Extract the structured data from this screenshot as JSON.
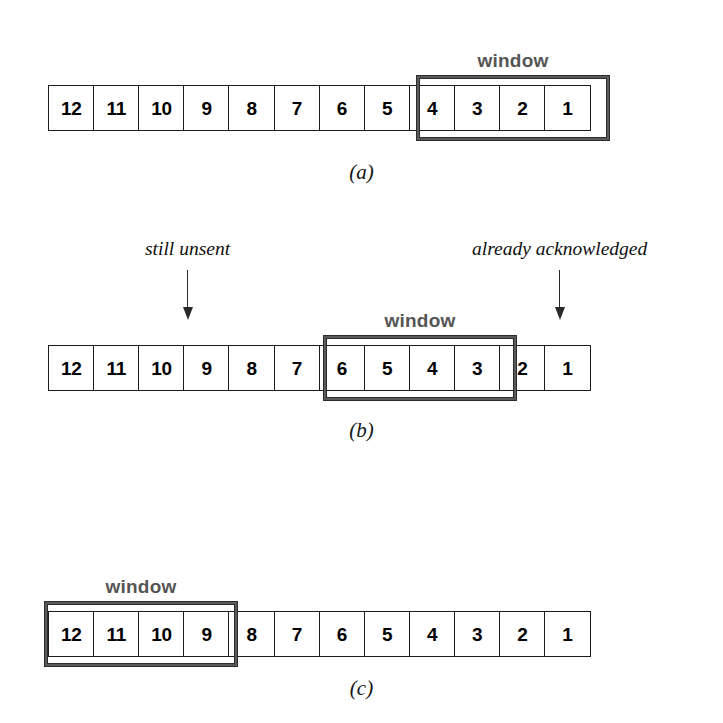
{
  "figure": {
    "colors": {
      "window_border": "#5a5a5a",
      "window_border_outline": "#2c2c2c",
      "window_label": "#555555",
      "cell_border": "#1b1b1b",
      "cell_text": "#000000",
      "annotation_text": "#101010",
      "background": "#ffffff"
    },
    "window_label_text": "window"
  },
  "panels": [
    {
      "id": "a",
      "caption": "(a)",
      "cells": [
        "12",
        "11",
        "10",
        "9",
        "8",
        "7",
        "6",
        "5",
        "4",
        "3",
        "2",
        "1"
      ],
      "window_label": "window",
      "window_start_index": 8,
      "window_end_index": 11,
      "window_cells": [
        "4",
        "3",
        "2",
        "1"
      ],
      "annotations": []
    },
    {
      "id": "b",
      "caption": "(b)",
      "cells": [
        "12",
        "11",
        "10",
        "9",
        "8",
        "7",
        "6",
        "5",
        "4",
        "3",
        "2",
        "1"
      ],
      "window_label": "window",
      "window_start_index": 6,
      "window_end_index": 9,
      "window_cells": [
        "6",
        "5",
        "4",
        "3"
      ],
      "annotations": [
        {
          "text": "still unsent",
          "points_to_index": 3
        },
        {
          "text": "already acknowledged",
          "points_to_index": 10
        }
      ]
    },
    {
      "id": "c",
      "caption": "(c)",
      "cells": [
        "12",
        "11",
        "10",
        "9",
        "8",
        "7",
        "6",
        "5",
        "4",
        "3",
        "2",
        "1"
      ],
      "window_label": "window",
      "window_start_index": 0,
      "window_end_index": 3,
      "window_cells": [
        "12",
        "11",
        "10",
        "9"
      ],
      "annotations": []
    }
  ]
}
